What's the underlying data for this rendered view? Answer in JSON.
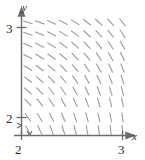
{
  "figure": {
    "kind": "slope-field-plot",
    "axis_label_x": "x",
    "axis_label_y": "y",
    "axis_color": "#6b6b72",
    "segment_color": "#9a9aa2",
    "background_color": "#ffffff",
    "ticks": {
      "x": [
        "2",
        "3"
      ],
      "y": [
        "2",
        "3"
      ]
    },
    "axis_break": true
  },
  "chart_data": {
    "type": "scatter",
    "title": "",
    "xlabel": "x",
    "ylabel": "y",
    "xlim": [
      2,
      3
    ],
    "ylim": [
      2,
      3
    ],
    "xticks": [
      2,
      3
    ],
    "yticks": [
      2,
      3
    ],
    "xtick_labels": [
      "2",
      "3"
    ],
    "ytick_labels": [
      "2",
      "3"
    ],
    "grid": false,
    "legend": null,
    "axes_broken_at_origin": true,
    "grid_columns": 9,
    "grid_rows": 10,
    "x_samples": [
      2.05,
      2.16,
      2.27,
      2.38,
      2.49,
      2.6,
      2.71,
      2.82,
      2.93
    ],
    "y_samples": [
      2.98,
      2.88,
      2.78,
      2.68,
      2.58,
      2.48,
      2.38,
      2.28,
      2.15,
      2.04
    ],
    "slopes": [
      [
        -0.3,
        -0.35,
        -0.42,
        -0.5,
        -0.6,
        -0.72,
        -0.86,
        -1.02,
        -1.22
      ],
      [
        -0.35,
        -0.41,
        -0.49,
        -0.58,
        -0.7,
        -0.84,
        -1.0,
        -1.2,
        -1.44
      ],
      [
        -0.41,
        -0.48,
        -0.57,
        -0.68,
        -0.82,
        -0.98,
        -1.18,
        -1.42,
        -1.7
      ],
      [
        -0.48,
        -0.56,
        -0.67,
        -0.8,
        -0.96,
        -1.16,
        -1.4,
        -1.68,
        -2.02
      ],
      [
        -0.57,
        -0.67,
        -0.8,
        -0.95,
        -1.15,
        -1.38,
        -1.66,
        -2.0,
        -2.4
      ],
      [
        -0.68,
        -0.8,
        -0.95,
        -1.14,
        -1.37,
        -1.65,
        -1.98,
        -2.4,
        -2.9
      ],
      [
        -0.82,
        -0.96,
        -1.15,
        -1.38,
        -1.66,
        -2.0,
        -2.42,
        -2.95,
        -3.6
      ],
      [
        -1.0,
        -1.18,
        -1.41,
        -1.7,
        -2.05,
        -2.5,
        -3.05,
        -3.8,
        -4.7
      ],
      [
        -1.3,
        -1.54,
        -1.85,
        -2.24,
        -2.75,
        -3.4,
        -4.3,
        -5.6,
        -7.4
      ],
      [
        -1.7,
        -2.05,
        -2.5,
        -3.1,
        -3.9,
        -5.0,
        -6.7,
        -9.5,
        -14.0
      ]
    ],
    "segment_pixel_length": 9
  }
}
